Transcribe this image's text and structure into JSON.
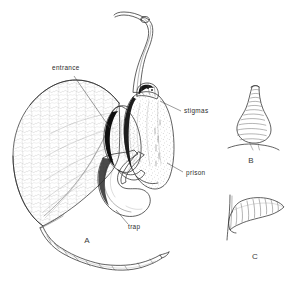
{
  "figure": {
    "background_color": "#ffffff",
    "ink_color": "#2e2e2e",
    "label_color": "#2b2b2b",
    "shadow_color": "#1c1c1c",
    "width": 296,
    "height": 290
  },
  "labels": [
    {
      "id": "entrance",
      "text": "entrance",
      "x": 52,
      "y": 70
    },
    {
      "id": "stigmas",
      "text": "stigmas",
      "x": 184,
      "y": 113
    },
    {
      "id": "prison",
      "text": "prison",
      "x": 186,
      "y": 175
    },
    {
      "id": "trap",
      "text": "trap",
      "x": 128,
      "y": 228
    }
  ],
  "figure_letters": [
    {
      "id": "A",
      "text": "A",
      "x": 87,
      "y": 242
    },
    {
      "id": "B",
      "text": "B",
      "x": 251,
      "y": 160
    },
    {
      "id": "C",
      "text": "C",
      "x": 255,
      "y": 258
    }
  ],
  "parts": {
    "limb": "spathe-limb",
    "tube": "curved-stalk",
    "tail": "twisted-tail",
    "column": "stigma-column",
    "chamber": "prison-chamber",
    "valve": "trap-valve"
  },
  "detail_b": {
    "caption": "B",
    "shape": "flask-shaped-utricle"
  },
  "detail_c": {
    "caption": "C",
    "shape": "hooked-banded-appendage"
  }
}
